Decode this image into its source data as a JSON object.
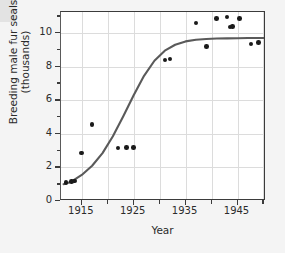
{
  "chart_data": {
    "type": "scatter",
    "title": "",
    "xlabel": "Year",
    "ylabel": "Breeding male fur seals (thousands)",
    "ylabel_line1": "Breeding male fur seals",
    "ylabel_line2": "(thousands)",
    "xlim": [
      1911,
      1950.5
    ],
    "ylim": [
      0,
      11.25
    ],
    "grid": true,
    "legend": "none",
    "x_major_ticks": [
      1915,
      1925,
      1935,
      1945
    ],
    "x_minor_ticks": [
      1920,
      1930,
      1940,
      1950
    ],
    "x_tick_labels": [
      "1915",
      "1925",
      "1935",
      "1945"
    ],
    "y_major_ticks": [
      0,
      2,
      4,
      6,
      8,
      10
    ],
    "y_minor_ticks": [
      1,
      3,
      5,
      7,
      9,
      11
    ],
    "y_tick_labels": [
      "0",
      "2",
      "4",
      "6",
      "8",
      "10"
    ],
    "series": [
      {
        "name": "Breeding male fur seals",
        "marker": "filled-circle",
        "color": "#1a1a1a",
        "x": [
          1912,
          1913,
          1913.6,
          1915,
          1917,
          1922,
          1923.6,
          1925,
          1931,
          1932,
          1937,
          1939,
          1941,
          1943,
          1943.6,
          1944,
          1945.4,
          1947.6,
          1949
        ],
        "y": [
          1.1,
          1.15,
          1.2,
          2.85,
          4.55,
          3.15,
          3.2,
          3.2,
          8.4,
          8.45,
          10.6,
          9.2,
          10.85,
          10.95,
          10.35,
          10.4,
          10.85,
          9.35,
          9.45
        ]
      }
    ],
    "fit_curve": {
      "name": "logistic growth fit",
      "type": "logistic",
      "color": "#5a5a5a",
      "asymptote": 9.7,
      "midpoint_year": 1926.5,
      "x": [
        1911.5,
        1913,
        1915,
        1917,
        1919,
        1921,
        1923,
        1925,
        1927,
        1929,
        1931,
        1933,
        1935,
        1937,
        1939,
        1941,
        1943,
        1945,
        1947,
        1950.4
      ],
      "y": [
        1.0,
        1.15,
        1.55,
        2.1,
        2.85,
        3.85,
        5.05,
        6.3,
        7.45,
        8.35,
        8.95,
        9.3,
        9.5,
        9.6,
        9.64,
        9.67,
        9.68,
        9.69,
        9.7,
        9.7
      ]
    }
  },
  "axes": {
    "x_title": "Year",
    "y_title_line1": "Breeding male fur seals",
    "y_title_line2": "(thousands)"
  }
}
